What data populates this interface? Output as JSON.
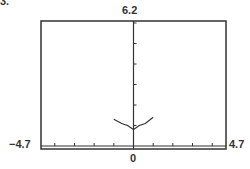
{
  "figure_label": "3.",
  "chart_data": {
    "type": "line",
    "title": "",
    "xlabel": "",
    "ylabel": "",
    "xlim": [
      -4.7,
      4.7
    ],
    "ylim": [
      null,
      6.2
    ],
    "grid": false,
    "window_labels": {
      "xmin": "−4.7",
      "xmax": "4.7",
      "ymax": "6.2",
      "origin": "0"
    },
    "x_ticks": [
      -4,
      -3,
      -2,
      -1,
      1,
      2,
      3,
      4
    ],
    "y_ticks": [
      1,
      2,
      3,
      4,
      5,
      6
    ],
    "series": [
      {
        "name": "f(x)",
        "x": [
          -1.0,
          -0.6,
          -0.3,
          0.0,
          0.3,
          0.6,
          1.0
        ],
        "y": [
          1.3,
          1.1,
          1.0,
          0.8,
          1.0,
          1.1,
          1.4
        ]
      }
    ]
  }
}
